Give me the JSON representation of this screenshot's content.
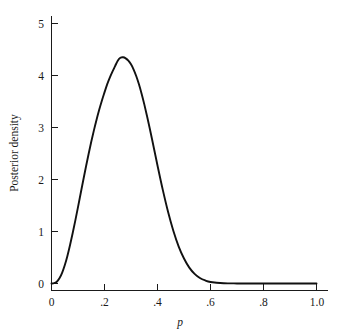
{
  "chart_data": {
    "type": "line",
    "title": "",
    "subtitle": "",
    "xlabel": "p",
    "ylabel": "Posterior density",
    "xlim": [
      0,
      1.0
    ],
    "ylim": [
      0,
      5
    ],
    "grid": false,
    "legend": null,
    "annotations": [],
    "xticks": [
      {
        "value": 0,
        "label": "0"
      },
      {
        "value": 0.2,
        "label": ".2"
      },
      {
        "value": 0.4,
        "label": ".4"
      },
      {
        "value": 0.6,
        "label": ".6"
      },
      {
        "value": 0.8,
        "label": ".8"
      },
      {
        "value": 1.0,
        "label": "1.0"
      }
    ],
    "yticks": [
      {
        "value": 0,
        "label": "0"
      },
      {
        "value": 1,
        "label": "1"
      },
      {
        "value": 2,
        "label": "2"
      },
      {
        "value": 3,
        "label": "3"
      },
      {
        "value": 4,
        "label": "4"
      },
      {
        "value": 5,
        "label": "5"
      }
    ],
    "series": [
      {
        "name": "Posterior density",
        "color": "#111111",
        "peak_x": 0.25,
        "peak_y": 4.35,
        "x": [
          0.0,
          0.01,
          0.02,
          0.03,
          0.04,
          0.05,
          0.06,
          0.07,
          0.08,
          0.09,
          0.1,
          0.11,
          0.12,
          0.13,
          0.14,
          0.15,
          0.16,
          0.17,
          0.18,
          0.19,
          0.2,
          0.21,
          0.22,
          0.23,
          0.24,
          0.25,
          0.26,
          0.27,
          0.28,
          0.29,
          0.3,
          0.31,
          0.32,
          0.33,
          0.34,
          0.35,
          0.36,
          0.37,
          0.38,
          0.39,
          0.4,
          0.42,
          0.44,
          0.46,
          0.48,
          0.5,
          0.52,
          0.54,
          0.56,
          0.58,
          0.6,
          0.65,
          0.7,
          0.75,
          0.8,
          0.85,
          0.9,
          0.95,
          1.0
        ],
        "y": [
          0.0,
          0.006,
          0.035,
          0.1,
          0.205,
          0.35,
          0.53,
          0.74,
          0.97,
          1.215,
          1.47,
          1.73,
          1.99,
          2.245,
          2.49,
          2.725,
          2.945,
          3.15,
          3.34,
          3.515,
          3.675,
          3.83,
          3.96,
          4.075,
          4.18,
          4.285,
          4.34,
          4.35,
          4.33,
          4.285,
          4.215,
          4.115,
          3.985,
          3.83,
          3.65,
          3.45,
          3.23,
          3.0,
          2.76,
          2.515,
          2.27,
          1.8,
          1.375,
          1.01,
          0.71,
          0.48,
          0.305,
          0.185,
          0.105,
          0.058,
          0.03,
          0.006,
          0.001,
          0.0,
          0.0,
          0.0,
          0.0,
          0.0,
          0.0
        ]
      }
    ]
  },
  "figure": {
    "background_color": "#ffffff",
    "axis_color": "#1a1a1a",
    "curve_color": "#111111"
  }
}
